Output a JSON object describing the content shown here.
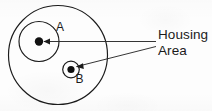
{
  "diagram": {
    "background_color": "#fdfdfd",
    "stroke_color": "#1b1b1b",
    "callouts": [
      {
        "id": "callout-housing",
        "label": "Housing",
        "points_to": "A"
      },
      {
        "id": "callout-area",
        "label": "Area",
        "points_to": "B"
      }
    ],
    "shapes": {
      "outer_circle": {
        "name": "outer-boundary-circle",
        "cx": 58,
        "cy": 55,
        "r": 49.5
      },
      "circle_a": {
        "name": "circle-a",
        "label": "A",
        "cx": 39,
        "cy": 41.5,
        "r": 20,
        "label_x": 56,
        "label_y": 31,
        "center_dot_r": 4.2
      },
      "circle_b": {
        "name": "circle-b",
        "label": "B",
        "cx": 71,
        "cy": 69.5,
        "r": 8.3,
        "label_x": 75.5,
        "label_y": 83,
        "center_dot_r": 3.6
      }
    },
    "leader_lines": [
      {
        "name": "leader-line-housing",
        "from_x": 44,
        "from_y": 41.5,
        "to_x": 156,
        "to_y": 41.5,
        "arrow": "start"
      },
      {
        "name": "leader-line-area",
        "from_x": 75.5,
        "from_y": 67,
        "to_x": 156,
        "to_y": 46.5,
        "arrow": "start"
      }
    ],
    "text_positions": {
      "housing_x": 158,
      "housing_y": 39,
      "area_x": 158,
      "area_y": 55
    }
  }
}
